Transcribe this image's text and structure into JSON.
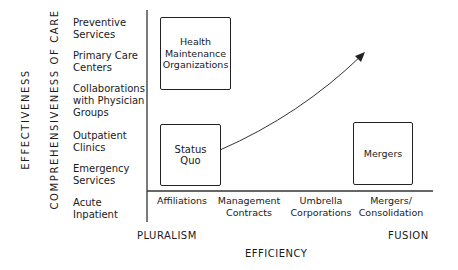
{
  "axes": {
    "y_outer_label": "EFFECTIVENESS",
    "y_inner_label": "COMPREHENSIVENESS OF CARE",
    "x_label": "EFFICIENCY",
    "x_left_pole": "PLURALISM",
    "x_right_pole": "FUSION"
  },
  "y_categories": [
    "Preventive\nServices",
    "Primary Care\nCenters",
    "Collaborations\nwith Physician\nGroups",
    "Outpatient\nClinics",
    "Emergency\nServices",
    "Acute\nInpatient"
  ],
  "x_categories": [
    "Affiliations",
    "Management\nContracts",
    "Umbrella\nCorporations",
    "Mergers/\nConsolidation"
  ],
  "boxes": {
    "hmo": "Health\nMaintenance\nOrganizations",
    "status_quo": "Status\nQuo",
    "mergers": "Mergers"
  },
  "colors": {
    "ink": "#1a1a1a",
    "background": "#ffffff"
  }
}
